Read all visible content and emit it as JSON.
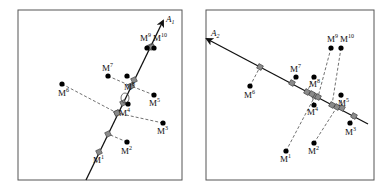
{
  "colors": {
    "line": "#111111",
    "frame": "#555555",
    "square_fill": "#8a8a8a",
    "square_stroke": "#444444",
    "dot": "#000000",
    "dash": "#333333"
  },
  "panels": [
    {
      "id": "left",
      "frame": {
        "x": 18,
        "y": 10,
        "w": 164,
        "h": 170
      },
      "axis": {
        "label": "A",
        "sub": "1",
        "x1": 86,
        "y1": 180,
        "x2": 163,
        "y2": 21,
        "label_x": 166,
        "label_y": 22
      },
      "points": [
        {
          "name": "M",
          "sup": "1",
          "dot": null,
          "proj": [
            99,
            152
          ],
          "label": [
            93,
            163
          ]
        },
        {
          "name": "M",
          "sup": "2",
          "dot": [
            127,
            142
          ],
          "proj": [
            108,
            134
          ],
          "label": [
            121,
            154
          ]
        },
        {
          "name": "M",
          "sup": "3",
          "dot": [
            163,
            123
          ],
          "proj": [
            117,
            113
          ],
          "label": [
            157,
            134
          ]
        },
        {
          "name": "M",
          "sup": "4",
          "dot": [
            128,
            104
          ],
          "proj": [
            123,
            103
          ],
          "label": [
            119,
            116
          ]
        },
        {
          "name": "M",
          "sup": "5",
          "dot": [
            154,
            95
          ],
          "proj": [
            131,
            86
          ],
          "label": [
            149,
            106
          ]
        },
        {
          "name": "M",
          "sup": "6",
          "dot": [
            62,
            84
          ],
          "proj": [
            117,
            113
          ],
          "label": [
            58,
            96
          ]
        },
        {
          "name": "M",
          "sup": "7",
          "dot": [
            108,
            76
          ],
          "proj": [
            131,
            86
          ],
          "label": [
            102,
            71
          ]
        },
        {
          "name": "M",
          "sup": "8",
          "dot": [
            127,
            76
          ],
          "proj": [
            134,
            80
          ],
          "label": [
            124,
            90
          ]
        },
        {
          "name": "M",
          "sup": "9",
          "dot": [
            147,
            48
          ],
          "proj": [
            150,
            47
          ],
          "label": [
            140,
            41
          ]
        },
        {
          "name": "M",
          "sup": "10",
          "dot": [
            154,
            48
          ],
          "proj": [
            152,
            47
          ],
          "label": [
            153,
            41
          ]
        }
      ]
    },
    {
      "id": "right",
      "frame": {
        "x": 206,
        "y": 10,
        "w": 168,
        "h": 170
      },
      "axis": {
        "label": "A",
        "sub": "2",
        "x1": 368,
        "y1": 124,
        "x2": 207,
        "y2": 39,
        "label_x": 211,
        "label_y": 36
      },
      "points": [
        {
          "name": "M",
          "sup": "1",
          "dot": [
            286,
            151
          ],
          "proj": [
            315,
            96
          ],
          "label": [
            280,
            162
          ]
        },
        {
          "name": "M",
          "sup": "2",
          "dot": [
            314,
            143
          ],
          "proj": [
            337,
            107
          ],
          "label": [
            308,
            154
          ]
        },
        {
          "name": "M",
          "sup": "3",
          "dot": [
            350,
            123
          ],
          "proj": [
            354,
            116
          ],
          "label": [
            345,
            135
          ]
        },
        {
          "name": "M",
          "sup": "4",
          "dot": [
            314,
            105
          ],
          "proj": [
            312,
            94
          ],
          "label": [
            307,
            115
          ]
        },
        {
          "name": "M",
          "sup": "5",
          "dot": [
            341,
            95
          ],
          "proj": [
            342,
            108
          ],
          "label": [
            338,
            106
          ]
        },
        {
          "name": "M",
          "sup": "6",
          "dot": [
            250,
            86
          ],
          "proj": [
            260,
            67
          ],
          "label": [
            244,
            98
          ]
        },
        {
          "name": "M",
          "sup": "7",
          "dot": [
            296,
            77
          ],
          "proj": [
            292,
            83
          ],
          "label": [
            290,
            72
          ]
        },
        {
          "name": "M",
          "sup": "8",
          "dot": [
            314,
            77
          ],
          "proj": [
            307,
            92
          ],
          "label": [
            309,
            87
          ]
        },
        {
          "name": "M",
          "sup": "9",
          "dot": [
            331,
            48
          ],
          "proj": [
            318,
            97
          ],
          "label": [
            327,
            42
          ]
        },
        {
          "name": "M",
          "sup": "10",
          "dot": [
            341,
            48
          ],
          "proj": [
            332,
            105
          ],
          "label": [
            340,
            42
          ]
        }
      ]
    }
  ]
}
